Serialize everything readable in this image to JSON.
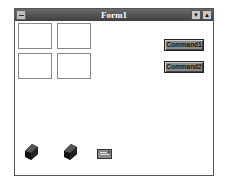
{
  "window": {
    "title": "Form1",
    "minimize_glyph": "▼",
    "maximize_glyph": "▲"
  },
  "frames": [
    {
      "name": "frame-1"
    },
    {
      "name": "frame-2"
    },
    {
      "name": "frame-3"
    },
    {
      "name": "frame-4"
    }
  ],
  "buttons": {
    "command1": "Command1",
    "command2": "Command2"
  },
  "icons": {
    "control_1": "cylinder-control-icon",
    "control_2": "cylinder-control-icon",
    "control_3": "envelope-control-icon"
  },
  "colors": {
    "titlebar": "#4a4a4a",
    "button_face": "#8a8a8a",
    "grid_dot": "#9a9a9a"
  }
}
